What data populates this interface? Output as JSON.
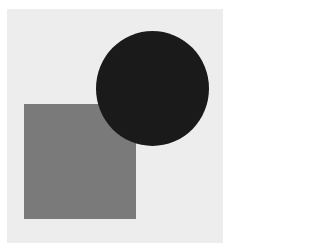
{
  "figure": {
    "background_color": "#ededed",
    "shapes": [
      {
        "type": "square",
        "color": "#7a7a7a"
      },
      {
        "type": "circle",
        "color": "#1a1a1a"
      }
    ]
  }
}
